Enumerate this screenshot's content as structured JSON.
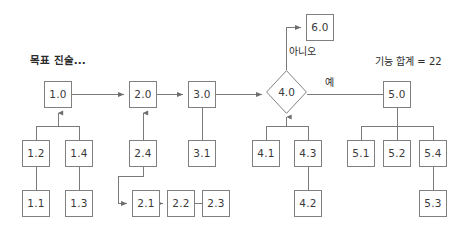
{
  "diagram": {
    "title_label": "목표 진술...",
    "summary_label": "기능 합계 = 22",
    "edge_labels": {
      "no": "아니오",
      "yes": "예"
    },
    "colors": {
      "node_border": "#808080",
      "connector": "#7a7a7a",
      "node_fill": "#ffffff",
      "text": "#3a3a3a",
      "background": "#ffffff"
    },
    "nodes": [
      {
        "id": "n1_0",
        "label": "1.0",
        "shape": "rect",
        "x": 44,
        "y": 81,
        "w": 28,
        "h": 27
      },
      {
        "id": "n1_2",
        "label": "1.2",
        "shape": "rect",
        "x": 22,
        "y": 140,
        "w": 28,
        "h": 27
      },
      {
        "id": "n1_4",
        "label": "1.4",
        "shape": "rect",
        "x": 65,
        "y": 140,
        "w": 28,
        "h": 27
      },
      {
        "id": "n1_1",
        "label": "1.1",
        "shape": "rect",
        "x": 22,
        "y": 190,
        "w": 28,
        "h": 27
      },
      {
        "id": "n1_3",
        "label": "1.3",
        "shape": "rect",
        "x": 65,
        "y": 190,
        "w": 28,
        "h": 27
      },
      {
        "id": "n2_0",
        "label": "2.0",
        "shape": "rect",
        "x": 129,
        "y": 81,
        "w": 28,
        "h": 27
      },
      {
        "id": "n2_4",
        "label": "2.4",
        "shape": "rect",
        "x": 129,
        "y": 140,
        "w": 28,
        "h": 27
      },
      {
        "id": "n2_1",
        "label": "2.1",
        "shape": "rect",
        "x": 132,
        "y": 190,
        "w": 28,
        "h": 27
      },
      {
        "id": "n2_2",
        "label": "2.2",
        "shape": "rect",
        "x": 167,
        "y": 190,
        "w": 28,
        "h": 27
      },
      {
        "id": "n2_3",
        "label": "2.3",
        "shape": "rect",
        "x": 202,
        "y": 190,
        "w": 28,
        "h": 27
      },
      {
        "id": "n3_0",
        "label": "3.0",
        "shape": "rect",
        "x": 188,
        "y": 81,
        "w": 28,
        "h": 27
      },
      {
        "id": "n3_1",
        "label": "3.1",
        "shape": "rect",
        "x": 188,
        "y": 140,
        "w": 28,
        "h": 27
      },
      {
        "id": "n4_0",
        "label": "4.0",
        "shape": "diamond",
        "x": 266,
        "y": 70,
        "w": 41,
        "h": 44
      },
      {
        "id": "n4_1",
        "label": "4.1",
        "shape": "rect",
        "x": 252,
        "y": 140,
        "w": 28,
        "h": 27
      },
      {
        "id": "n4_3",
        "label": "4.3",
        "shape": "rect",
        "x": 294,
        "y": 140,
        "w": 28,
        "h": 27
      },
      {
        "id": "n4_2",
        "label": "4.2",
        "shape": "rect",
        "x": 294,
        "y": 190,
        "w": 28,
        "h": 27
      },
      {
        "id": "n6_0",
        "label": "6.0",
        "shape": "rect",
        "x": 306,
        "y": 14,
        "w": 28,
        "h": 27
      },
      {
        "id": "n5_0",
        "label": "5.0",
        "shape": "rect",
        "x": 383,
        "y": 81,
        "w": 28,
        "h": 27
      },
      {
        "id": "n5_1",
        "label": "5.1",
        "shape": "rect",
        "x": 347,
        "y": 140,
        "w": 28,
        "h": 27
      },
      {
        "id": "n5_2",
        "label": "5.2",
        "shape": "rect",
        "x": 383,
        "y": 140,
        "w": 28,
        "h": 27
      },
      {
        "id": "n5_4",
        "label": "5.4",
        "shape": "rect",
        "x": 419,
        "y": 140,
        "w": 28,
        "h": 27
      },
      {
        "id": "n5_3",
        "label": "5.3",
        "shape": "rect",
        "x": 419,
        "y": 190,
        "w": 28,
        "h": 27
      }
    ],
    "edges": [
      {
        "from": "n1_0",
        "to": "n2_0",
        "kind": "arrow-right"
      },
      {
        "from": "n2_0",
        "to": "n3_0",
        "kind": "arrow-right"
      },
      {
        "from": "n3_0",
        "to": "n4_0",
        "kind": "arrow-right"
      },
      {
        "from": "n1_2",
        "to": "n1_0",
        "kind": "arrow-up-tree"
      },
      {
        "from": "n1_4",
        "to": "n1_0",
        "kind": "arrow-up-tree"
      },
      {
        "from": "n1_1",
        "to": "n1_2",
        "kind": "line-up"
      },
      {
        "from": "n1_3",
        "to": "n1_4",
        "kind": "line-up"
      },
      {
        "from": "n2_4",
        "to": "n2_0",
        "kind": "arrow-up"
      },
      {
        "from": "n2_4",
        "to": "n2_1",
        "kind": "elbow-arrow"
      },
      {
        "from": "n2_1",
        "to": "n2_2",
        "kind": "arrow-right"
      },
      {
        "from": "n2_2",
        "to": "n2_3",
        "kind": "line-right"
      },
      {
        "from": "n3_1",
        "to": "n3_0",
        "kind": "line-up"
      },
      {
        "from": "n4_0",
        "to": "n6_0",
        "kind": "elbow-arrow-no"
      },
      {
        "from": "n4_0",
        "to": "n5_0",
        "kind": "line-right-yes"
      },
      {
        "from": "n4_1",
        "to": "n4_0",
        "kind": "arrow-up-tree"
      },
      {
        "from": "n4_3",
        "to": "n4_0",
        "kind": "arrow-up-tree"
      },
      {
        "from": "n4_2",
        "to": "n4_3",
        "kind": "line-up"
      },
      {
        "from": "n5_1",
        "to": "n5_0",
        "kind": "line-up-tree"
      },
      {
        "from": "n5_2",
        "to": "n5_0",
        "kind": "line-up-tree"
      },
      {
        "from": "n5_4",
        "to": "n5_0",
        "kind": "line-up-tree"
      },
      {
        "from": "n5_3",
        "to": "n5_4",
        "kind": "line-up"
      }
    ]
  }
}
